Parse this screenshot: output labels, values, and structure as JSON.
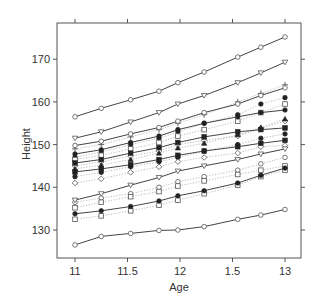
{
  "chart_data": {
    "type": "line",
    "title": "",
    "xlabel": "Age",
    "ylabel": "Height",
    "xlim": [
      10.87,
      13.15
    ],
    "ylim": [
      123.5,
      177.5
    ],
    "x_ticks": [
      11,
      11.5,
      12,
      12.5,
      13
    ],
    "x_tick_labels": [
      "11",
      "11.5",
      "12",
      "1.5",
      "13"
    ],
    "y_ticks": [
      130,
      140,
      150,
      160,
      170
    ],
    "y_tick_labels": [
      "130",
      "140",
      "150",
      "160",
      "170"
    ],
    "grid": false,
    "legend": null,
    "x": [
      11.0,
      11.25,
      11.53,
      11.8,
      11.98,
      12.23,
      12.55,
      12.77,
      13.0
    ],
    "series": [
      {
        "name": "subject-1",
        "style": "solid",
        "marker": "circle",
        "values": [
          156.5,
          158.5,
          160.5,
          162.5,
          164.5,
          167.0,
          170.5,
          172.8,
          175.2
        ]
      },
      {
        "name": "subject-2",
        "style": "solid",
        "marker": "triangle-down",
        "values": [
          151.5,
          153.0,
          155.3,
          157.5,
          159.5,
          161.5,
          164.5,
          166.8,
          169.3
        ]
      },
      {
        "name": "subject-3",
        "style": "solid",
        "marker": "circle",
        "values": [
          149.8,
          150.8,
          152.5,
          154.0,
          155.5,
          157.5,
          159.5,
          161.5,
          163.3
        ]
      },
      {
        "name": "subject-4",
        "style": "dotted",
        "marker": "plus",
        "values": [
          149.0,
          150.0,
          151.8,
          153.5,
          155.0,
          157.0,
          160.0,
          162.0,
          164.0
        ]
      },
      {
        "name": "subject-5",
        "style": "solid",
        "marker": "filled-circle",
        "values": [
          147.8,
          148.8,
          150.5,
          152.0,
          153.5,
          155.0,
          156.5,
          157.5,
          158.1
        ]
      },
      {
        "name": "subject-6",
        "style": "dotted",
        "marker": "filled-circle",
        "values": [
          147.0,
          148.3,
          150.0,
          151.5,
          153.0,
          155.0,
          157.0,
          159.5,
          161.0
        ]
      },
      {
        "name": "subject-7",
        "style": "dotted",
        "marker": "square",
        "values": [
          146.5,
          147.5,
          149.0,
          150.5,
          152.0,
          153.5,
          155.5,
          157.5,
          159.5
        ]
      },
      {
        "name": "subject-8",
        "style": "solid",
        "marker": "filled-square",
        "values": [
          145.7,
          146.5,
          148.0,
          149.3,
          150.5,
          151.8,
          153.0,
          153.5,
          153.9
        ]
      },
      {
        "name": "subject-9",
        "style": "dotted",
        "marker": "diamond",
        "values": [
          145.0,
          146.0,
          147.3,
          148.5,
          150.0,
          151.0,
          152.0,
          153.8,
          155.5
        ]
      },
      {
        "name": "subject-10",
        "style": "dotted",
        "marker": "filled-triangle",
        "values": [
          144.3,
          145.2,
          146.5,
          148.0,
          149.2,
          150.3,
          152.3,
          154.0,
          156.0
        ]
      },
      {
        "name": "subject-11",
        "style": "solid",
        "marker": "filled-square",
        "values": [
          143.6,
          144.3,
          145.3,
          146.5,
          147.5,
          148.5,
          149.5,
          150.3,
          151.0
        ]
      },
      {
        "name": "subject-12",
        "style": "dotted",
        "marker": "filled-circle",
        "values": [
          142.5,
          143.5,
          144.8,
          146.0,
          147.0,
          148.5,
          150.0,
          151.5,
          152.5
        ]
      },
      {
        "name": "subject-13",
        "style": "dotted",
        "marker": "diamond",
        "values": [
          141.0,
          142.0,
          143.5,
          144.8,
          146.0,
          147.0,
          148.0,
          149.5,
          149.8
        ]
      },
      {
        "name": "subject-14",
        "style": "solid",
        "marker": "triangle-down",
        "values": [
          137.0,
          138.5,
          140.5,
          142.3,
          143.8,
          145.0,
          146.5,
          147.8,
          149.0
        ]
      },
      {
        "name": "subject-15",
        "style": "dotted",
        "marker": "circle",
        "values": [
          136.5,
          137.5,
          138.5,
          140.0,
          141.3,
          142.5,
          144.0,
          145.5,
          147.0
        ]
      },
      {
        "name": "subject-16",
        "style": "dotted",
        "marker": "square",
        "values": [
          135.2,
          136.5,
          137.8,
          139.0,
          140.3,
          141.5,
          143.0,
          144.0,
          145.0
        ]
      },
      {
        "name": "subject-17",
        "style": "solid",
        "marker": "filled-circle",
        "values": [
          133.8,
          134.5,
          135.5,
          136.8,
          138.0,
          139.2,
          141.0,
          142.8,
          144.5
        ]
      },
      {
        "name": "subject-18",
        "style": "dotted",
        "marker": "square",
        "values": [
          132.5,
          133.3,
          134.5,
          135.8,
          137.0,
          138.5,
          140.5,
          142.5,
          144.0
        ]
      },
      {
        "name": "subject-19",
        "style": "solid",
        "marker": "circle",
        "values": [
          126.5,
          128.5,
          129.2,
          129.9,
          130.0,
          130.8,
          132.5,
          133.5,
          134.8
        ]
      }
    ]
  },
  "markup": {
    "x_axis_title": "Age",
    "y_axis_title": "Height"
  }
}
